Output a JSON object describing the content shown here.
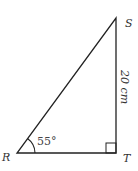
{
  "diagram": {
    "type": "right-triangle",
    "vertices": {
      "R": {
        "label": "R"
      },
      "S": {
        "label": "S"
      },
      "T": {
        "label": "T"
      }
    },
    "side_ST": {
      "label": "20 cm"
    },
    "angle_R": {
      "label": "55°"
    },
    "right_angle_at": "T",
    "colors": {
      "stroke": "#222222",
      "text": "#333333"
    }
  }
}
